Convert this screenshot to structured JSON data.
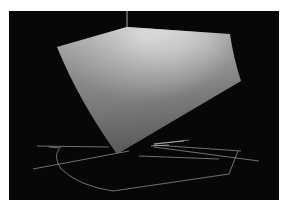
{
  "image": {
    "description": "3D rendered gray shaded solid (gamut-like volume) on black background with thin white wireframe ground outline and vertical axis line",
    "background_color": "#070707",
    "solid_color_light": "#d8d8d8",
    "solid_color_dark": "#5a5a5a",
    "wire_color": "#bdbdbd"
  },
  "caption_fragment": "..."
}
